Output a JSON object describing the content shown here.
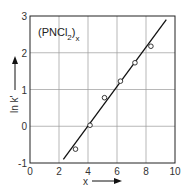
{
  "chart_data": {
    "type": "scatter",
    "title": "(PNCl2)x",
    "title_main": "(PNCl",
    "title_sub": "2",
    "title_close": ")",
    "title_sub2": "x",
    "xlabel": "x",
    "ylabel": "ln k'",
    "xlim": [
      0,
      10
    ],
    "ylim": [
      -1,
      3
    ],
    "x_ticks": [
      "0",
      "2",
      "4",
      "6",
      "8",
      "10"
    ],
    "y_ticks": [
      "-1",
      "0",
      "1",
      "2",
      "3"
    ],
    "grid": true,
    "series": [
      {
        "name": "(PNCl2)x",
        "marker": "open-circle",
        "x": [
          3.0,
          4.0,
          5.0,
          6.1,
          7.1,
          8.2
        ],
        "y": [
          -0.65,
          0.0,
          0.75,
          1.2,
          1.7,
          2.15
        ]
      }
    ],
    "fit_line": {
      "x": [
        2.3,
        9.4
      ],
      "y": [
        -0.9,
        2.9
      ]
    }
  }
}
